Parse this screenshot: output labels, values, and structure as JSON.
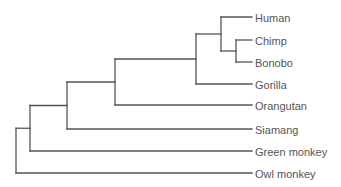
{
  "diagram": {
    "type": "phylogenetic-tree",
    "line_color": "#555555",
    "label_color": "#555555",
    "leaves": [
      {
        "id": "human",
        "label": "Human",
        "y": 17
      },
      {
        "id": "chimp",
        "label": "Chimp",
        "y": 40
      },
      {
        "id": "bonobo",
        "label": "Bonobo",
        "y": 62
      },
      {
        "id": "gorilla",
        "label": "Gorilla",
        "y": 84
      },
      {
        "id": "orangutan",
        "label": "Orangutan",
        "y": 105
      },
      {
        "id": "siamang",
        "label": "Siamang",
        "y": 129
      },
      {
        "id": "green-monkey",
        "label": "Green monkey",
        "y": 151
      },
      {
        "id": "owl-monkey",
        "label": "Owl monkey",
        "y": 173
      }
    ],
    "tip_x": 252,
    "label_x": 255,
    "clades": [
      {
        "id": "chimp-bonobo",
        "x": 236,
        "children": [
          "chimp",
          "bonobo"
        ]
      },
      {
        "id": "homo-pan",
        "x": 221,
        "children": [
          "human",
          "chimp-bonobo"
        ]
      },
      {
        "id": "homininae",
        "x": 196,
        "children": [
          "homo-pan",
          "gorilla"
        ]
      },
      {
        "id": "hominidae",
        "x": 115,
        "children": [
          "homininae",
          "orangutan"
        ]
      },
      {
        "id": "hominoidea",
        "x": 67,
        "children": [
          "hominidae",
          "siamang"
        ]
      },
      {
        "id": "catarrhini",
        "x": 30,
        "children": [
          "hominoidea",
          "green-monkey"
        ]
      },
      {
        "id": "root",
        "x": 16,
        "children": [
          "catarrhini",
          "owl-monkey"
        ]
      }
    ]
  }
}
